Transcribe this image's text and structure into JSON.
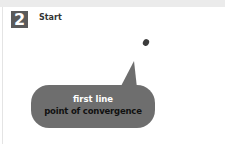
{
  "step": {
    "number": "2",
    "title": "Start"
  },
  "callout": {
    "line1": "first line",
    "line2": "point of convergence"
  },
  "colors": {
    "badge": "#5a5a5a",
    "bubble": "#6e6e6e",
    "dot": "#3c3c3c",
    "line1_text": "#ffffff",
    "line2_text": "#111111"
  }
}
